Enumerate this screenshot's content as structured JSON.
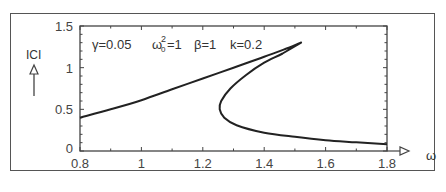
{
  "chart_data": {
    "type": "line",
    "title": "",
    "annotation": {
      "gamma": "γ=0.05",
      "omega0": "ω",
      "omega0_sup": "2",
      "omega0_sub": "0",
      "omega0_val": "=1",
      "beta": "β=1",
      "k": "k=0.2"
    },
    "xlabel": "ω",
    "ylabel": "ICI",
    "xlim": [
      0.8,
      1.8
    ],
    "ylim": [
      0,
      1.5
    ],
    "xticks": [
      0.8,
      1.0,
      1.2,
      1.4,
      1.6,
      1.8
    ],
    "xtick_labels": [
      "0.8",
      "1",
      "1.2",
      "1.4",
      "1.6",
      "1.8"
    ],
    "yticks": [
      0,
      0.5,
      1.0,
      1.5
    ],
    "ytick_labels": [
      "0",
      "0.5",
      "1",
      "1.5"
    ],
    "grid": false,
    "series": [
      {
        "name": "|C|(ω)",
        "points": [
          [
            0.8,
            0.4
          ],
          [
            0.9,
            0.5
          ],
          [
            1.0,
            0.61
          ],
          [
            1.1,
            0.74
          ],
          [
            1.2,
            0.87
          ],
          [
            1.3,
            1.0
          ],
          [
            1.4,
            1.13
          ],
          [
            1.48,
            1.24
          ],
          [
            1.52,
            1.3
          ],
          [
            1.46,
            1.17
          ],
          [
            1.4,
            1.06
          ],
          [
            1.34,
            0.91
          ],
          [
            1.29,
            0.75
          ],
          [
            1.26,
            0.6
          ],
          [
            1.255,
            0.5
          ],
          [
            1.27,
            0.4
          ],
          [
            1.31,
            0.31
          ],
          [
            1.4,
            0.22
          ],
          [
            1.5,
            0.17
          ],
          [
            1.6,
            0.13
          ],
          [
            1.7,
            0.105
          ],
          [
            1.8,
            0.08
          ]
        ]
      }
    ]
  }
}
